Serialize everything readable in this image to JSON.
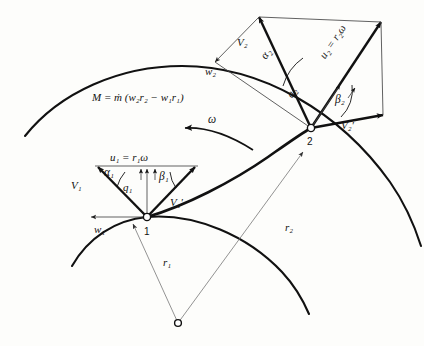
{
  "figure": {
    "domain": "engineering-diagram",
    "background_color": "#fdfdfb",
    "ink_color": "#111111",
    "thin_ink_color": "#777777"
  },
  "equation": {
    "moment_label": "M = ṁ (w₂r₂ − w₁r₁)",
    "M": "M",
    "equals": "=",
    "mdot": "ṁ",
    "open_paren": "(",
    "w2r2": "w₂r₂",
    "minus": "−",
    "w1r1": "w₁r₁",
    "close_paren": ")"
  },
  "rotation": {
    "symbol": "ω",
    "direction": "counter-clockwise"
  },
  "nodes": [
    {
      "id": "1",
      "label": "1",
      "x": 147,
      "y": 217,
      "description": "impeller inlet station"
    },
    {
      "id": "2",
      "label": "2",
      "x": 310,
      "y": 128,
      "description": "impeller outlet station"
    },
    {
      "id": "center",
      "label": "",
      "x": 178,
      "y": 323,
      "description": "axis of rotation"
    }
  ],
  "radii": [
    {
      "name": "r1",
      "label": "r₁",
      "label_x": 163,
      "label_y": 263,
      "from": "center",
      "to": "node-1"
    },
    {
      "name": "r2",
      "label": "r₂",
      "label_x": 285,
      "label_y": 228,
      "from": "center",
      "to": "node-2"
    }
  ],
  "inlet_triangle": {
    "station": "1",
    "vectors": [
      {
        "name": "V1",
        "label": "V₁",
        "label_x": 78,
        "label_y": 186,
        "style": "thick",
        "description": "absolute velocity at inlet"
      },
      {
        "name": "V1-prime",
        "label": "V₁′",
        "label_x": 176,
        "label_y": 203,
        "style": "thick",
        "description": "relative velocity at inlet"
      },
      {
        "name": "u1",
        "label": "u₁ = r₁ω",
        "label_x": 120,
        "label_y": 160,
        "style": "thin",
        "description": "blade speed at inlet"
      },
      {
        "name": "w1",
        "label": "w₁",
        "label_x": 99,
        "label_y": 229,
        "style": "thin",
        "description": "tangential component at inlet"
      },
      {
        "name": "q1",
        "label": "q₁",
        "label_x": 127,
        "label_y": 187,
        "style": "thin",
        "description": "meridional component at inlet"
      }
    ],
    "angles": [
      {
        "name": "alpha1",
        "label": "α₁",
        "label_x": 110,
        "label_y": 175,
        "description": "absolute flow angle at inlet"
      },
      {
        "name": "beta1",
        "label": "β₁",
        "label_x": 163,
        "label_y": 179,
        "description": "relative flow angle at inlet"
      }
    ]
  },
  "outlet_triangle": {
    "station": "2",
    "vectors": [
      {
        "name": "V2",
        "label": "V₂",
        "label_x": 243,
        "label_y": 42,
        "style": "thick",
        "description": "absolute velocity at outlet"
      },
      {
        "name": "V2-prime",
        "label": "V₂′",
        "label_x": 348,
        "label_y": 124,
        "style": "thick",
        "description": "relative velocity at outlet"
      },
      {
        "name": "u2",
        "label": "u₂ = r₂ω",
        "label_x": 328,
        "label_y": 55,
        "style": "thick",
        "description": "blade speed at outlet"
      },
      {
        "name": "w2",
        "label": "w₂",
        "label_x": 211,
        "label_y": 70,
        "style": "thin",
        "description": "tangential component at outlet"
      },
      {
        "name": "q2",
        "label": "q₂",
        "label_x": 294,
        "label_y": 95,
        "style": "thin",
        "description": "meridional component at outlet"
      }
    ],
    "angles": [
      {
        "name": "alpha2",
        "label": "α₂",
        "label_x": 271,
        "label_y": 59,
        "description": "absolute flow angle at outlet"
      },
      {
        "name": "beta2",
        "label": "β₂",
        "label_x": 340,
        "label_y": 101,
        "description": "relative flow angle at outlet"
      }
    ]
  },
  "curves": [
    {
      "name": "outer-shroud-arc",
      "description": "outer circular arc of impeller passage"
    },
    {
      "name": "inner-hub-arc",
      "description": "inner circular arc of impeller passage"
    },
    {
      "name": "blade-curve",
      "description": "thick curved impeller blade from station 1 to station 2"
    }
  ]
}
